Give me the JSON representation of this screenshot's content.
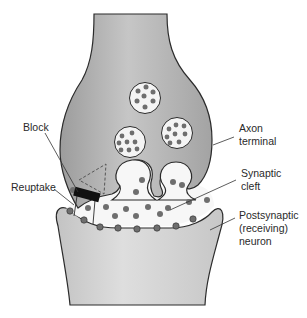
{
  "diagram": {
    "type": "neuron-synapse-illustration",
    "labels": {
      "block": "Block",
      "reuptake": "Reuptake",
      "axon_terminal_line1": "Axon",
      "axon_terminal_line2": "terminal",
      "synaptic_cleft_line1": "Synaptic",
      "synaptic_cleft_line2": "cleft",
      "postsynaptic_line1": "Postsynaptic",
      "postsynaptic_line2": "(receiving)",
      "postsynaptic_line3": "neuron"
    },
    "colors": {
      "axon_fill": "#a9a9a9",
      "axon_highlight": "#c4c4c4",
      "postsynaptic_fill": "#c8c8c8",
      "outline": "#2b2b2b",
      "vesicle_fill": "#f4f4f4",
      "neurotransmitter": "#6e6e6e",
      "block": "#111111",
      "cleft": "#f7f7f7"
    },
    "vesicles": [
      {
        "cx": 145,
        "cy": 98,
        "r": 16
      },
      {
        "cx": 130,
        "cy": 142,
        "r": 16
      },
      {
        "cx": 177,
        "cy": 133,
        "r": 16
      }
    ]
  }
}
